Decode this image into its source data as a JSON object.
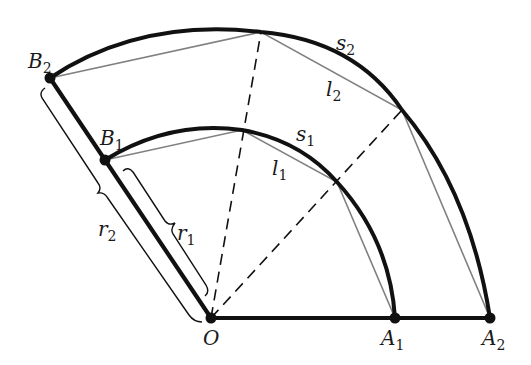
{
  "figure": {
    "colors": {
      "ink": "#111111",
      "chord": "#808080",
      "background": "#ffffff"
    },
    "points": {
      "O": {
        "label": "O",
        "x": 211,
        "y": 318
      },
      "A1": {
        "label": "A",
        "sub": "1",
        "x": 395,
        "y": 318
      },
      "A2": {
        "label": "A",
        "sub": "2",
        "x": 490,
        "y": 318
      },
      "B1": {
        "label": "B",
        "sub": "1",
        "x": 105,
        "y": 160
      },
      "B2": {
        "label": "B",
        "sub": "2",
        "x": 50,
        "y": 78
      }
    },
    "arc_labels": {
      "s1": {
        "label": "s",
        "sub": "1"
      },
      "s2": {
        "label": "s",
        "sub": "2"
      },
      "l1": {
        "label": "l",
        "sub": "1"
      },
      "l2": {
        "label": "l",
        "sub": "2"
      }
    },
    "radius_labels": {
      "r1": {
        "label": "r",
        "sub": "1"
      },
      "r2": {
        "label": "r",
        "sub": "2"
      }
    }
  }
}
